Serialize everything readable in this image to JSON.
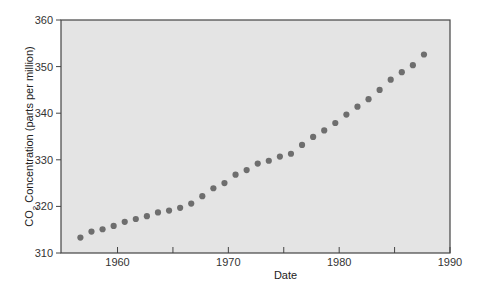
{
  "chart_data": {
    "type": "scatter",
    "title": "",
    "xlabel": "Date",
    "ylabel": "CO2 Concentration (parts per million)",
    "ylabel_parts": {
      "pre": "CO",
      "sub": "2",
      "post": " Concentration (parts per million)"
    },
    "xlim": [
      1954.9,
      1990
    ],
    "ylim": [
      310,
      360
    ],
    "x_ticks": [
      1960,
      1970,
      1980,
      1990
    ],
    "x_minor_ticks": [
      1965,
      1975,
      1985
    ],
    "y_ticks": [
      310,
      320,
      330,
      340,
      350,
      360
    ],
    "grid": false,
    "legend": null,
    "colors": {
      "plot_bg": "#e4e4e4",
      "marker": "#6e6e6e",
      "axis": "#444444"
    },
    "series": [
      {
        "name": "CO2 concentration",
        "x": [
          1957,
          1958,
          1959,
          1960,
          1961,
          1962,
          1963,
          1964,
          1965,
          1966,
          1967,
          1968,
          1969,
          1970,
          1971,
          1972,
          1973,
          1974,
          1975,
          1976,
          1977,
          1978,
          1979,
          1980,
          1981,
          1982,
          1983,
          1984,
          1985,
          1986,
          1987,
          1988
        ],
        "y": [
          313.3,
          314.6,
          315.1,
          315.8,
          316.7,
          317.3,
          317.9,
          318.7,
          319.1,
          319.7,
          320.6,
          322.2,
          323.9,
          325.0,
          326.8,
          327.8,
          329.2,
          329.8,
          330.7,
          331.3,
          333.2,
          334.9,
          336.3,
          337.9,
          339.7,
          341.4,
          343.0,
          345.0,
          347.2,
          348.8,
          350.3,
          352.6
        ]
      }
    ]
  }
}
